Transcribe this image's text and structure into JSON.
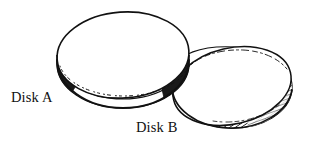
{
  "figure": {
    "type": "line-drawing",
    "background_color": "#ffffff",
    "ink_color": "#111111",
    "labels": [
      {
        "id": "disk-a",
        "text": "Disk A",
        "x": 11,
        "y": 90
      },
      {
        "id": "disk-b",
        "text": "Disk B",
        "x": 136,
        "y": 120
      }
    ],
    "objects": [
      {
        "id": "disk-a",
        "name": "Disk A",
        "shape": "ellipse",
        "center_x": 123,
        "center_y": 56,
        "radius_x": 66,
        "radius_y": 44,
        "rotation_deg": -6,
        "thickness": 9,
        "depth_order": "front",
        "rim_style": "stippled",
        "fill": "#ffffff"
      },
      {
        "id": "disk-b",
        "name": "Disk B",
        "shape": "ellipse",
        "center_x": 233,
        "center_y": 88,
        "radius_x": 62,
        "radius_y": 42,
        "rotation_deg": -14,
        "thickness": 10,
        "depth_order": "back",
        "rim_style": "hatched",
        "fill": "#ffffff"
      }
    ]
  }
}
